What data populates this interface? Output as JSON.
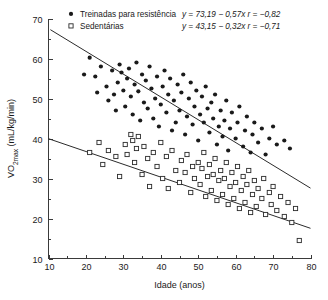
{
  "chart_data": {
    "type": "scatter",
    "title": "",
    "xlabel": "Idade (anos)",
    "ylabel": "VO2max (mL/kg/min)",
    "ylabel_parts": {
      "pre": "VO",
      "sub": "2max",
      "post": " (mL/kg/min)"
    },
    "xlim": [
      10,
      80
    ],
    "ylim": [
      10,
      70
    ],
    "xticks": [
      10,
      20,
      30,
      40,
      50,
      60,
      70,
      80
    ],
    "yticks": [
      10,
      20,
      30,
      40,
      50,
      60,
      70
    ],
    "xminor_step": 5,
    "yminor_step": 5,
    "grid": false,
    "legend_position": "top",
    "series": [
      {
        "name": "Treinadas para resistência",
        "marker": "filled-circle",
        "color": "#1a1a1a",
        "equation": "y = 73,19 − 0,57x",
        "correlation": "r = −0,82",
        "fit": {
          "intercept": 73.19,
          "slope": -0.57,
          "r": -0.82,
          "x_from": 10.5,
          "x_to": 80
        },
        "points": [
          [
            19.5,
            56.0
          ],
          [
            21.0,
            60.2
          ],
          [
            22.5,
            55.5
          ],
          [
            23.0,
            51.5
          ],
          [
            24.0,
            58.0
          ],
          [
            25.5,
            53.0
          ],
          [
            26.0,
            49.5
          ],
          [
            27.0,
            57.0
          ],
          [
            27.5,
            51.0
          ],
          [
            28.0,
            47.0
          ],
          [
            28.5,
            54.0
          ],
          [
            29.0,
            58.5
          ],
          [
            29.5,
            56.5
          ],
          [
            30.0,
            52.0
          ],
          [
            30.5,
            48.0
          ],
          [
            31.0,
            55.0
          ],
          [
            31.5,
            57.5
          ],
          [
            32.0,
            50.5
          ],
          [
            32.5,
            46.0
          ],
          [
            33.0,
            53.5
          ],
          [
            33.5,
            59.0
          ],
          [
            34.0,
            51.8
          ],
          [
            34.5,
            44.5
          ],
          [
            35.0,
            56.0
          ],
          [
            35.5,
            49.0
          ],
          [
            36.0,
            54.5
          ],
          [
            36.5,
            47.5
          ],
          [
            37.0,
            58.0
          ],
          [
            37.5,
            52.5
          ],
          [
            38.0,
            45.0
          ],
          [
            38.5,
            50.0
          ],
          [
            39.0,
            55.5
          ],
          [
            39.5,
            43.0
          ],
          [
            40.0,
            48.5
          ],
          [
            40.5,
            53.0
          ],
          [
            41.0,
            57.0
          ],
          [
            41.5,
            46.5
          ],
          [
            42.0,
            51.0
          ],
          [
            42.5,
            55.0
          ],
          [
            43.0,
            42.0
          ],
          [
            43.5,
            49.5
          ],
          [
            44.0,
            44.0
          ],
          [
            44.5,
            53.5
          ],
          [
            45.0,
            47.0
          ],
          [
            45.5,
            51.5
          ],
          [
            46.0,
            56.0
          ],
          [
            46.5,
            41.0
          ],
          [
            47.0,
            45.5
          ],
          [
            47.5,
            50.0
          ],
          [
            48.0,
            54.0
          ],
          [
            48.5,
            43.5
          ],
          [
            49.0,
            48.0
          ],
          [
            49.5,
            52.0
          ],
          [
            50.0,
            39.5
          ],
          [
            50.5,
            46.0
          ],
          [
            51.0,
            50.5
          ],
          [
            51.5,
            44.0
          ],
          [
            52.0,
            53.0
          ],
          [
            52.5,
            47.5
          ],
          [
            53.0,
            41.5
          ],
          [
            53.5,
            49.0
          ],
          [
            54.0,
            45.0
          ],
          [
            54.5,
            51.0
          ],
          [
            55.0,
            38.5
          ],
          [
            55.5,
            43.0
          ],
          [
            56.0,
            47.0
          ],
          [
            56.5,
            40.5
          ],
          [
            57.0,
            44.5
          ],
          [
            57.5,
            49.5
          ],
          [
            58.0,
            37.0
          ],
          [
            58.5,
            42.5
          ],
          [
            59.0,
            46.5
          ],
          [
            60.0,
            40.0
          ],
          [
            60.5,
            44.0
          ],
          [
            61.0,
            48.0
          ],
          [
            62.0,
            38.0
          ],
          [
            62.5,
            42.0
          ],
          [
            63.0,
            45.5
          ],
          [
            64.0,
            36.5
          ],
          [
            64.5,
            41.0
          ],
          [
            65.0,
            44.0
          ],
          [
            66.0,
            39.0
          ],
          [
            67.0,
            42.5
          ],
          [
            68.0,
            36.0
          ],
          [
            69.0,
            40.0
          ],
          [
            70.0,
            43.0
          ],
          [
            71.0,
            38.5
          ],
          [
            73.0,
            39.5
          ],
          [
            74.5,
            37.5
          ]
        ]
      },
      {
        "name": "Sedentárias",
        "marker": "open-square",
        "color": "#2b2b2b",
        "equation": "y = 43,15 − 0,32x",
        "correlation": "r = −0,71",
        "fit": {
          "intercept": 43.15,
          "slope": -0.32,
          "r": -0.71,
          "x_from": 10,
          "x_to": 80
        },
        "points": [
          [
            21.0,
            36.5
          ],
          [
            23.5,
            39.0
          ],
          [
            24.5,
            33.5
          ],
          [
            26.0,
            37.0
          ],
          [
            28.0,
            35.5
          ],
          [
            29.0,
            30.5
          ],
          [
            30.5,
            38.5
          ],
          [
            31.0,
            36.0
          ],
          [
            32.0,
            41.0
          ],
          [
            32.5,
            39.5
          ],
          [
            33.0,
            34.0
          ],
          [
            33.5,
            37.5
          ],
          [
            34.0,
            40.5
          ],
          [
            35.0,
            31.0
          ],
          [
            35.5,
            38.0
          ],
          [
            36.5,
            35.0
          ],
          [
            37.0,
            28.0
          ],
          [
            38.0,
            36.5
          ],
          [
            39.0,
            33.0
          ],
          [
            40.0,
            39.0
          ],
          [
            40.5,
            30.0
          ],
          [
            41.5,
            35.5
          ],
          [
            42.0,
            27.5
          ],
          [
            43.0,
            37.0
          ],
          [
            44.0,
            32.0
          ],
          [
            45.0,
            29.0
          ],
          [
            45.5,
            34.5
          ],
          [
            46.5,
            31.5
          ],
          [
            47.0,
            36.0
          ],
          [
            48.0,
            26.5
          ],
          [
            48.5,
            33.0
          ],
          [
            49.0,
            30.0
          ],
          [
            50.0,
            34.0
          ],
          [
            50.5,
            28.5
          ],
          [
            51.0,
            32.5
          ],
          [
            51.5,
            36.5
          ],
          [
            52.0,
            25.5
          ],
          [
            52.5,
            30.5
          ],
          [
            53.0,
            33.5
          ],
          [
            53.5,
            27.0
          ],
          [
            54.0,
            31.0
          ],
          [
            54.5,
            35.0
          ],
          [
            55.0,
            24.5
          ],
          [
            55.5,
            29.5
          ],
          [
            56.0,
            32.0
          ],
          [
            56.5,
            26.0
          ],
          [
            57.0,
            30.0
          ],
          [
            57.5,
            34.0
          ],
          [
            58.0,
            23.5
          ],
          [
            58.5,
            28.0
          ],
          [
            59.0,
            31.5
          ],
          [
            59.5,
            25.0
          ],
          [
            60.0,
            29.0
          ],
          [
            60.5,
            33.0
          ],
          [
            61.0,
            22.5
          ],
          [
            61.5,
            27.0
          ],
          [
            62.0,
            30.5
          ],
          [
            62.5,
            24.0
          ],
          [
            63.0,
            28.5
          ],
          [
            63.5,
            32.0
          ],
          [
            64.0,
            21.5
          ],
          [
            64.5,
            26.0
          ],
          [
            65.0,
            29.5
          ],
          [
            65.5,
            23.0
          ],
          [
            66.0,
            27.5
          ],
          [
            67.0,
            25.0
          ],
          [
            67.5,
            30.0
          ],
          [
            68.0,
            21.0
          ],
          [
            69.0,
            26.5
          ],
          [
            69.5,
            23.5
          ],
          [
            70.0,
            28.0
          ],
          [
            71.0,
            22.0
          ],
          [
            72.0,
            25.5
          ],
          [
            73.0,
            20.5
          ],
          [
            74.0,
            24.0
          ],
          [
            75.0,
            19.0
          ],
          [
            76.0,
            22.5
          ],
          [
            77.0,
            14.5
          ]
        ]
      }
    ]
  }
}
